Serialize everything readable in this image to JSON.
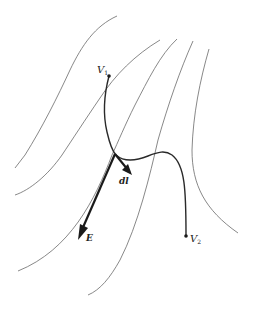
{
  "diagram": {
    "colors": {
      "background": "#ffffff",
      "field_lines": "#6a6a6a",
      "path": "#2a2a2a",
      "vectors": "#1a1a1a"
    },
    "labels": {
      "v1_main": "V",
      "v1_sub": "1",
      "v2_main": "V",
      "v2_sub": "2",
      "e_vector": "E",
      "dl_vector": "dl"
    },
    "field_line_count": 5,
    "vectors": [
      "E",
      "dl"
    ],
    "endpoints": [
      "V1",
      "V2"
    ]
  }
}
